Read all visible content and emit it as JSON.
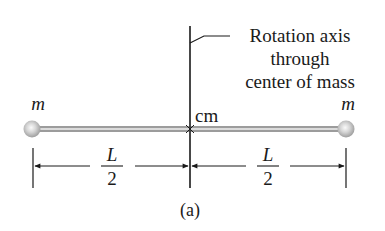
{
  "diagram": {
    "type": "physics-dumbbell-rotation",
    "axis_label": {
      "lines": [
        "Rotation axis",
        "through",
        "center of mass"
      ]
    },
    "center_label": "cm",
    "masses": [
      {
        "label": "m",
        "position": "left"
      },
      {
        "label": "m",
        "position": "right"
      }
    ],
    "dimensions": [
      {
        "numerator": "L",
        "denominator": "2",
        "segment": "left-half"
      },
      {
        "numerator": "L",
        "denominator": "2",
        "segment": "right-half"
      }
    ],
    "caption": "(a)",
    "colors": {
      "line": "#1a1a1a",
      "ball_center": "#f2f2f2",
      "ball_edge": "#9a9a9a",
      "background": "#ffffff"
    }
  }
}
